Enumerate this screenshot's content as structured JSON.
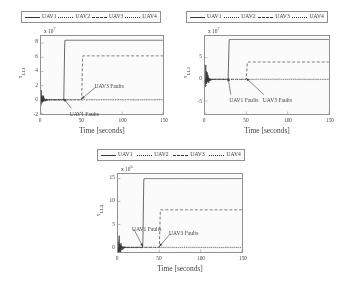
{
  "figure": {
    "legend_entries": [
      {
        "label": "UAV1",
        "style": "solid"
      },
      {
        "label": "UAV2",
        "style": "dotted"
      },
      {
        "label": "UAV3",
        "style": "dashed"
      },
      {
        "label": "UAV4",
        "style": "dotted"
      }
    ],
    "xlabel": "Time [seconds]",
    "annotation_uav1": "UAV1 Faults",
    "annotation_uav3": "UAV3 Faults"
  },
  "chart_data": [
    {
      "type": "line",
      "title": "",
      "xlabel": "Time [seconds]",
      "ylabel": "τ",
      "ylabel_sub": "LL1",
      "y_exponent": "x 10",
      "y_exponent_power": "7",
      "xlim": [
        0,
        150
      ],
      "ylim": [
        -2,
        9
      ],
      "xticks": [
        0,
        50,
        100,
        150
      ],
      "yticks": [
        -2,
        0,
        2,
        4,
        6,
        8
      ],
      "grid": false,
      "legend_position": "above",
      "series": [
        {
          "name": "UAV1",
          "style": "solid",
          "step_time": 28,
          "plateau": 8.4,
          "noise_amp": 2.0
        },
        {
          "name": "UAV2",
          "style": "dotted",
          "step_time": null,
          "plateau": 0.05,
          "noise_amp": 1.2
        },
        {
          "name": "UAV3",
          "style": "dashed",
          "step_time": 50,
          "plateau": 6.2,
          "noise_amp": 0.8
        },
        {
          "name": "UAV4",
          "style": "dotted",
          "step_time": null,
          "plateau": 0.12,
          "noise_amp": 1.0
        }
      ],
      "annotations": [
        {
          "text": "UAV3 Faults",
          "x": 66,
          "y": 2.2
        },
        {
          "text": "UAV1 Faults",
          "x": 36,
          "y": -1.6
        }
      ]
    },
    {
      "type": "line",
      "title": "",
      "xlabel": "Time [seconds]",
      "ylabel": "τ",
      "ylabel_sub": "LL2",
      "y_exponent": "x 10",
      "y_exponent_power": "7",
      "xlim": [
        0,
        150
      ],
      "ylim": [
        -8,
        10
      ],
      "xticks": [
        0,
        50,
        100,
        150
      ],
      "yticks": [
        -5,
        0,
        5
      ],
      "grid": false,
      "legend_position": "above",
      "series": [
        {
          "name": "UAV1",
          "style": "solid",
          "step_time": 28,
          "plateau": 9.2,
          "noise_amp": 5.0
        },
        {
          "name": "UAV2",
          "style": "dotted",
          "step_time": null,
          "plateau": 0.05,
          "noise_amp": 3.0
        },
        {
          "name": "UAV3",
          "style": "dashed",
          "step_time": 50,
          "plateau": 4.0,
          "noise_amp": 2.0
        },
        {
          "name": "UAV4",
          "style": "dotted",
          "step_time": null,
          "plateau": 0.1,
          "noise_amp": 2.5
        }
      ],
      "annotations": [
        {
          "text": "UAV1 Faults",
          "x": 30,
          "y": -4.2
        },
        {
          "text": "UAV3 Faults",
          "x": 70,
          "y": -4.2
        }
      ]
    },
    {
      "type": "line",
      "title": "",
      "xlabel": "Time [seconds]",
      "ylabel": "τ",
      "ylabel_sub": "LL4",
      "y_exponent": "x 10",
      "y_exponent_power": "6",
      "xlim": [
        0,
        150
      ],
      "ylim": [
        -1,
        16
      ],
      "xticks": [
        0,
        50,
        100,
        150
      ],
      "yticks": [
        0,
        5,
        10,
        15
      ],
      "grid": false,
      "legend_position": "above",
      "series": [
        {
          "name": "UAV1",
          "style": "solid",
          "step_time": 30,
          "plateau": 15.0,
          "noise_amp": 4.5
        },
        {
          "name": "UAV2",
          "style": "dotted",
          "step_time": null,
          "plateau": 0.05,
          "noise_amp": 2.5
        },
        {
          "name": "UAV3",
          "style": "dashed",
          "step_time": 50,
          "plateau": 8.2,
          "noise_amp": 1.5
        },
        {
          "name": "UAV4",
          "style": "dotted",
          "step_time": null,
          "plateau": 0.1,
          "noise_amp": 2.0
        }
      ],
      "annotations": [
        {
          "text": "UAV1 Faults",
          "x": 18,
          "y": 4.6
        },
        {
          "text": "UAV3 Faults",
          "x": 62,
          "y": 3.6
        }
      ]
    }
  ]
}
